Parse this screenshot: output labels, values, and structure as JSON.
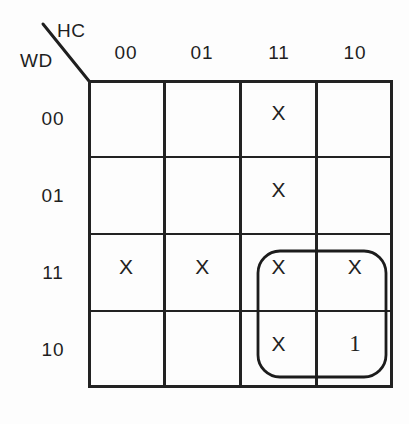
{
  "diagram": {
    "type": "karnaugh-map",
    "title": "",
    "axis_labels": {
      "columns_variable": "HC",
      "rows_variable": "WD"
    },
    "column_headers": [
      "00",
      "01",
      "11",
      "10"
    ],
    "row_headers": [
      "00",
      "01",
      "11",
      "10"
    ],
    "cells": [
      {
        "row": "00",
        "col": "00",
        "value": ""
      },
      {
        "row": "00",
        "col": "01",
        "value": ""
      },
      {
        "row": "00",
        "col": "11",
        "value": "X"
      },
      {
        "row": "00",
        "col": "10",
        "value": ""
      },
      {
        "row": "01",
        "col": "00",
        "value": ""
      },
      {
        "row": "01",
        "col": "01",
        "value": ""
      },
      {
        "row": "01",
        "col": "11",
        "value": "X"
      },
      {
        "row": "01",
        "col": "10",
        "value": ""
      },
      {
        "row": "11",
        "col": "00",
        "value": "X"
      },
      {
        "row": "11",
        "col": "01",
        "value": "X"
      },
      {
        "row": "11",
        "col": "11",
        "value": "X"
      },
      {
        "row": "11",
        "col": "10",
        "value": "X"
      },
      {
        "row": "10",
        "col": "00",
        "value": ""
      },
      {
        "row": "10",
        "col": "01",
        "value": ""
      },
      {
        "row": "10",
        "col": "11",
        "value": "X"
      },
      {
        "row": "10",
        "col": "10",
        "value": "1"
      }
    ],
    "groups": [
      {
        "name": "prime-implicant-loop",
        "shape": "rounded-rectangle",
        "covers_rows": [
          "11",
          "10"
        ],
        "covers_columns": [
          "11",
          "10"
        ]
      }
    ],
    "colors": {
      "ink": "#1a1a1a",
      "grid_line": "#222222",
      "background": "#fdfdfd"
    }
  }
}
